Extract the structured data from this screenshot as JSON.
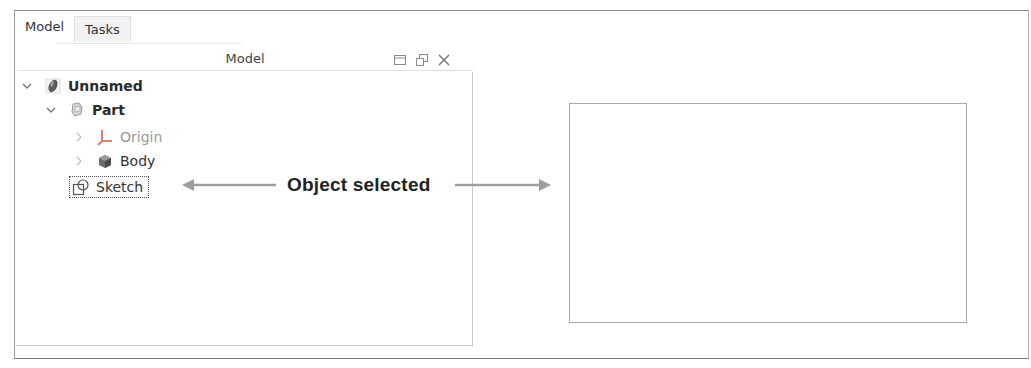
{
  "tabs": [
    {
      "label": "Model",
      "active": true
    },
    {
      "label": "Tasks",
      "active": false
    }
  ],
  "panel": {
    "title": "Model",
    "icons": [
      "dock-icon",
      "float-restore-icon",
      "close-icon"
    ]
  },
  "tree": {
    "items": [
      {
        "label": "Unnamed",
        "level": 0,
        "expanded": true,
        "icon": "document-icon",
        "style": "bold"
      },
      {
        "label": "Part",
        "level": 1,
        "expanded": true,
        "icon": "part-icon",
        "style": "bold"
      },
      {
        "label": "Origin",
        "level": 2,
        "expanded": false,
        "icon": "origin-axes-icon",
        "style": "dim"
      },
      {
        "label": "Body",
        "level": 2,
        "expanded": false,
        "icon": "body-icon",
        "style": "normal"
      },
      {
        "label": "Sketch",
        "level": 1,
        "expanded": null,
        "icon": "sketch-icon",
        "style": "selected"
      }
    ]
  },
  "annotation": {
    "text": "Object selected"
  },
  "colors": {
    "arrow": "#9e9e9e",
    "border": "#a8a8a8",
    "origin_red": "#d98070"
  }
}
